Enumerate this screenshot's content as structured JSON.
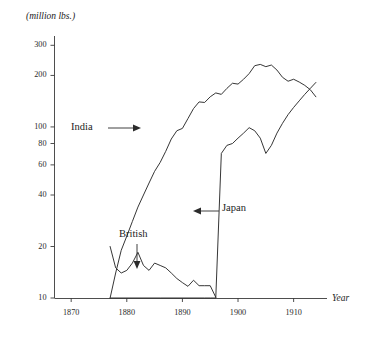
{
  "chart_data": {
    "type": "line",
    "title": "",
    "subtitle": "",
    "unit_label": "(million lbs.)",
    "xlabel": "Year",
    "ylabel": "",
    "yscale": "log",
    "ylim": [
      10,
      340
    ],
    "xlim": [
      1867,
      1916
    ],
    "grid": false,
    "legend_position": "inline-annotations",
    "y_ticks": [
      {
        "value": 10,
        "label": "10"
      },
      {
        "value": 20,
        "label": "20"
      },
      {
        "value": 40,
        "label": "40"
      },
      {
        "value": 60,
        "label": "60"
      },
      {
        "value": 80,
        "label": "80"
      },
      {
        "value": 100,
        "label": "100"
      },
      {
        "value": 200,
        "label": "200"
      },
      {
        "value": 300,
        "label": "300"
      }
    ],
    "x_ticks": [
      {
        "value": 1870,
        "label": "1870"
      },
      {
        "value": 1880,
        "label": "1880"
      },
      {
        "value": 1890,
        "label": "1890"
      },
      {
        "value": 1900,
        "label": "1900"
      },
      {
        "value": 1910,
        "label": "1910"
      }
    ],
    "annotations": [
      {
        "name": "india",
        "text": "India",
        "arrow": "right"
      },
      {
        "name": "british",
        "text": "British",
        "arrow": "down"
      },
      {
        "name": "japan",
        "text": "Japan",
        "arrow": "left"
      }
    ],
    "series": [
      {
        "name": "India",
        "color": "#2b2b2b",
        "x": [
          1877,
          1878,
          1879,
          1880,
          1881,
          1882,
          1883,
          1884,
          1885,
          1886,
          1887,
          1888,
          1889,
          1890,
          1891,
          1892,
          1893,
          1894,
          1895,
          1896,
          1897,
          1898,
          1899,
          1900,
          1901,
          1902,
          1903,
          1904,
          1905,
          1906,
          1907,
          1908,
          1909,
          1910,
          1911,
          1912,
          1913,
          1914
        ],
        "values": [
          10,
          14,
          19,
          23,
          28,
          34,
          40,
          47,
          55,
          62,
          72,
          85,
          95,
          98,
          112,
          128,
          140,
          139,
          150,
          158,
          155,
          168,
          180,
          178,
          190,
          205,
          228,
          232,
          225,
          230,
          215,
          195,
          185,
          190,
          183,
          175,
          165,
          150
        ]
      },
      {
        "name": "British",
        "color": "#2b2b2b",
        "x": [
          1877,
          1878,
          1879,
          1880,
          1881,
          1882,
          1883,
          1884,
          1885,
          1886,
          1887,
          1888,
          1889,
          1890,
          1891,
          1892,
          1893,
          1894,
          1895,
          1896
        ],
        "values": [
          20,
          15,
          14,
          14.5,
          16,
          18.5,
          15.5,
          14.5,
          16,
          15.5,
          15,
          14,
          13,
          12.3,
          11.7,
          12.7,
          11.8,
          11.8,
          11.8,
          10.1
        ]
      },
      {
        "name": "Japan",
        "color": "#2b2b2b",
        "x": [
          1877,
          1886,
          1894,
          1895,
          1896,
          1897,
          1898,
          1899,
          1900,
          1901,
          1902,
          1903,
          1904,
          1905,
          1906,
          1907,
          1908,
          1909,
          1910,
          1911,
          1912,
          1913,
          1914
        ],
        "values": [
          10,
          10,
          10,
          10,
          10,
          70,
          78,
          80,
          86,
          92,
          99,
          95,
          86,
          70,
          78,
          92,
          105,
          118,
          130,
          142,
          155,
          168,
          182
        ]
      }
    ]
  },
  "axis": {
    "y_axis_name": "value-axis-log",
    "x_axis_name": "year-axis"
  }
}
